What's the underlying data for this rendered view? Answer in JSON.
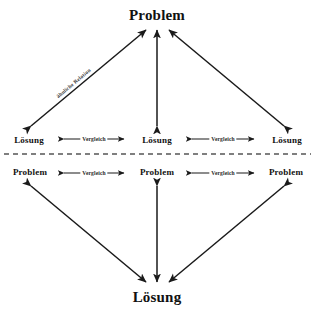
{
  "diagram": {
    "colors": {
      "line": "#1a1a1a",
      "text": "#111111",
      "divider": "#555555",
      "background": "#ffffff"
    },
    "top_section": {
      "apex": {
        "label": "Problem"
      },
      "row": [
        {
          "label": "Lösung"
        },
        {
          "label": "Lösung"
        },
        {
          "label": "Lösung"
        }
      ],
      "horizontal_links": [
        {
          "label": "Vergleich"
        },
        {
          "label": "Vergleich"
        }
      ],
      "diagonal_link": {
        "label": "ähnliche Relation"
      }
    },
    "divider": {
      "style": "dashed"
    },
    "bottom_section": {
      "row": [
        {
          "label": "Problem"
        },
        {
          "label": "Problem"
        },
        {
          "label": "Problem"
        }
      ],
      "horizontal_links": [
        {
          "label": "Vergleich"
        },
        {
          "label": "Vergleich"
        }
      ],
      "apex": {
        "label": "Lösung"
      }
    }
  }
}
